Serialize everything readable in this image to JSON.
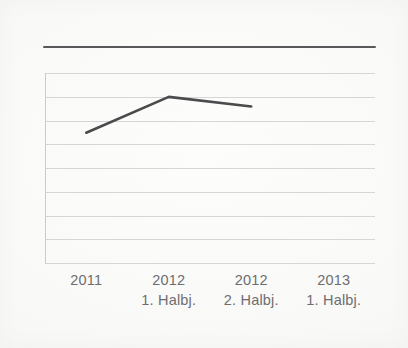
{
  "chart_data": {
    "type": "line",
    "title": "",
    "subtitle": "",
    "xlabel": "",
    "ylabel": "",
    "categories": [
      "2011",
      "2012 1. Halbj.",
      "2012 2. Halbj.",
      "2013 1. Halbj."
    ],
    "x_tick_labels": [
      {
        "year": "2011",
        "period": ""
      },
      {
        "year": "2012",
        "period": "1. Halbj."
      },
      {
        "year": "2012",
        "period": "2. Halbj."
      },
      {
        "year": "2013",
        "period": "1. Halbj."
      }
    ],
    "series": [
      {
        "name": "",
        "values": [
          5.5,
          7.0,
          6.6,
          null
        ],
        "points": [
          {
            "category": "2011",
            "value": 5.5
          },
          {
            "category": "2012 1. Halbj.",
            "value": 7.0
          },
          {
            "category": "2012 2. Halbj.",
            "value": 6.6
          },
          {
            "category": "2013 1. Halbj.",
            "value": null
          }
        ],
        "color": "#4b4b4d"
      }
    ],
    "ylim": [
      0,
      8
    ],
    "y_tick_values": [
      0,
      1,
      2,
      3,
      4,
      5,
      6,
      7,
      8
    ],
    "y_tick_labels": [],
    "gridlines": 9,
    "grid": true,
    "legend": false,
    "legend_position": "none"
  },
  "style": {
    "background_color": "#fbfbfa",
    "grid_color": "#cfcfcc",
    "line_color": "#4b4b4d",
    "rule_color": "#4b4b4d",
    "label_color": "#6e6e70"
  },
  "figure": {
    "top_rule": true,
    "axis_left": true,
    "plot_frame": true
  }
}
